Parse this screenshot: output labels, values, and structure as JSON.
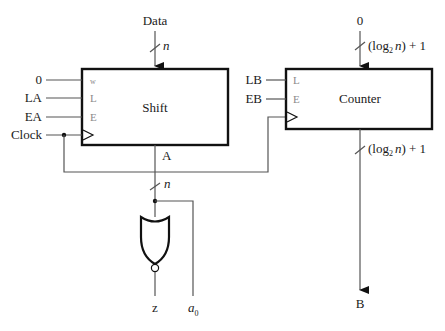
{
  "diagram": {
    "type": "datapath-circuit",
    "inputs": {
      "data": "Data",
      "data_width": "n",
      "counter_init": "0",
      "counter_width": "(log2 n) + 1"
    },
    "shift_register": {
      "title": "Shift",
      "pins": [
        "w",
        "L",
        "E"
      ],
      "pin_inputs": [
        "0",
        "LA",
        "EA"
      ],
      "clock": "Clock",
      "output": "A",
      "output_width": "n"
    },
    "counter": {
      "title": "Counter",
      "pins": [
        "L",
        "E"
      ],
      "pin_inputs": [
        "LB",
        "EB"
      ],
      "output_width": "(log2 n) + 1",
      "output": "B"
    },
    "gate": {
      "type": "NOR",
      "output": "z"
    },
    "bit_output": {
      "base": "a",
      "sub": "0"
    },
    "log_text": {
      "open": "(log",
      "sub": "2",
      "n": "n",
      "close": ") + 1"
    }
  }
}
